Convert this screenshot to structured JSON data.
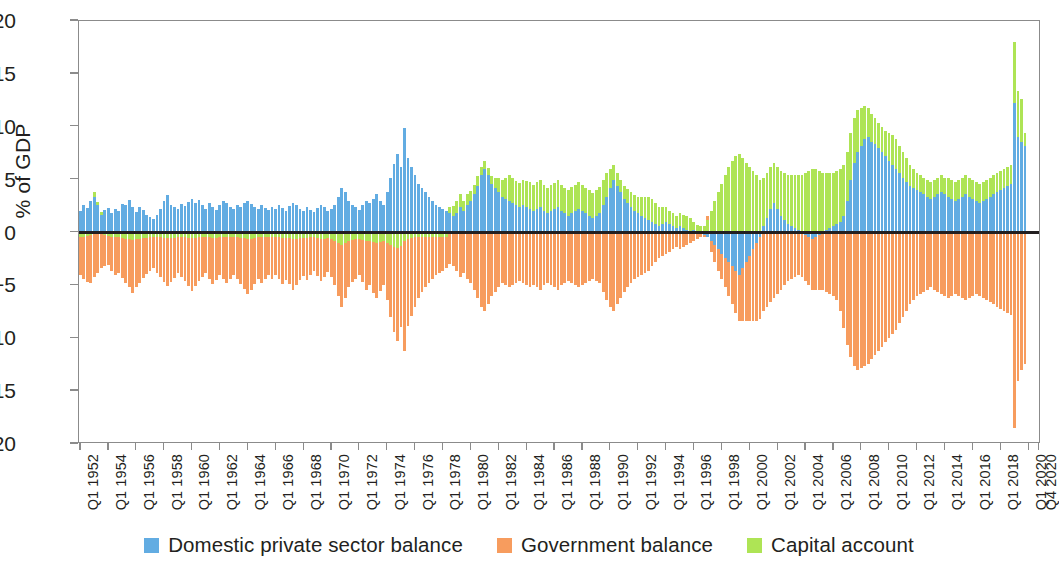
{
  "chart_data": {
    "type": "bar",
    "title": "",
    "subtitle": "",
    "xlabel": "",
    "ylabel": "% of GDP",
    "ylim": [
      -20,
      20
    ],
    "yticks": [
      20,
      15,
      10,
      5,
      0,
      -5,
      -10,
      -15,
      -20
    ],
    "ytick_labels": [
      "20",
      "15",
      "10",
      "5",
      "0",
      "−5",
      "−10",
      "−15",
      "−20"
    ],
    "grid": false,
    "stacked": true,
    "legend_position": "bottom",
    "bar_orientation": "vertical",
    "x_label_rotation": -90,
    "xtick_labels": [
      "Q1 1952",
      "Q1 1954",
      "Q1 1956",
      "Q1 1958",
      "Q1 1960",
      "Q1 1962",
      "Q1 1964",
      "Q1 1966",
      "Q1 1968",
      "Q1 1970",
      "Q1 1972",
      "Q1 1974",
      "Q1 1976",
      "Q1 1978",
      "Q1 1980",
      "Q1 1982",
      "Q1 1984",
      "Q1 1986",
      "Q1 1988",
      "Q1 1990",
      "Q1 1992",
      "Q1 1994",
      "Q1 1996",
      "Q1 1998",
      "Q1 2000",
      "Q1 2002",
      "Q1 2004",
      "Q1 2006",
      "Q1 2008",
      "Q1 2010",
      "Q1 2012",
      "Q1 2014",
      "Q1 2016",
      "Q1 2018",
      "Q1 2020",
      "Q4 2020"
    ],
    "xtick_quarter_index": [
      0,
      8,
      16,
      24,
      32,
      40,
      48,
      56,
      64,
      72,
      80,
      88,
      96,
      104,
      112,
      120,
      128,
      136,
      144,
      152,
      160,
      168,
      176,
      184,
      192,
      200,
      208,
      216,
      224,
      232,
      240,
      248,
      256,
      264,
      272,
      275
    ],
    "x_start": "Q1 1952",
    "x_end": "Q4 2020",
    "n_points": 276,
    "colors": {
      "domestic_private_sector_balance": "#62ACE2",
      "government_balance": "#F79C5E",
      "capital_account": "#AEE455",
      "axis": "#8b8b8b",
      "zero_line": "#231f20",
      "text": "#231f20",
      "background": "#ffffff"
    },
    "series": [
      {
        "name": "Domestic private sector balance",
        "color": "#62ACE2",
        "values": [
          2.0,
          2.6,
          2.3,
          3.0,
          3.4,
          2.6,
          1.7,
          2.1,
          2.3,
          1.8,
          2.2,
          2.0,
          2.7,
          2.6,
          3.1,
          2.4,
          1.9,
          2.4,
          2.1,
          1.7,
          1.5,
          1.3,
          1.7,
          2.2,
          3.0,
          3.5,
          2.6,
          2.4,
          2.2,
          2.7,
          2.5,
          2.9,
          3.2,
          2.8,
          3.1,
          2.6,
          2.2,
          2.8,
          2.4,
          2.1,
          2.6,
          3.0,
          2.8,
          2.4,
          2.2,
          2.6,
          2.4,
          2.8,
          3.0,
          2.7,
          2.4,
          2.2,
          2.6,
          2.3,
          2.1,
          2.4,
          2.2,
          2.6,
          2.3,
          2.0,
          2.5,
          2.8,
          2.6,
          2.2,
          2.0,
          2.4,
          2.1,
          1.9,
          2.3,
          2.6,
          2.4,
          2.0,
          2.2,
          2.6,
          3.4,
          4.2,
          3.8,
          3.0,
          2.6,
          2.4,
          2.1,
          2.6,
          3.0,
          2.8,
          3.2,
          3.6,
          3.0,
          2.6,
          3.8,
          5.2,
          6.5,
          7.4,
          6.2,
          9.9,
          7.0,
          6.2,
          5.4,
          4.6,
          4.2,
          3.8,
          3.4,
          3.0,
          2.6,
          2.4,
          2.2,
          2.0,
          1.8,
          1.6,
          1.8,
          2.4,
          2.0,
          2.6,
          3.0,
          3.6,
          4.4,
          5.4,
          6.0,
          5.4,
          4.6,
          4.2,
          3.8,
          3.4,
          3.2,
          3.0,
          2.8,
          2.6,
          2.4,
          2.6,
          2.4,
          2.2,
          2.0,
          2.2,
          2.4,
          2.0,
          1.8,
          2.0,
          2.2,
          2.4,
          2.0,
          1.8,
          1.6,
          1.8,
          2.0,
          2.2,
          2.0,
          1.8,
          1.6,
          1.4,
          1.6,
          1.8,
          2.6,
          3.4,
          4.2,
          5.0,
          4.4,
          3.8,
          3.2,
          2.8,
          2.4,
          2.0,
          1.8,
          1.6,
          1.4,
          1.2,
          1.0,
          0.8,
          0.6,
          0.8,
          1.0,
          0.8,
          0.6,
          0.4,
          0.6,
          0.4,
          0.2,
          0.1,
          0.2,
          0.1,
          0.0,
          -0.2,
          -0.4,
          -0.8,
          -1.2,
          -1.6,
          -2.0,
          -2.4,
          -2.8,
          -3.2,
          -3.6,
          -4.0,
          -3.4,
          -2.8,
          -2.2,
          -1.6,
          -1.0,
          -0.4,
          0.6,
          1.4,
          2.2,
          2.8,
          2.2,
          1.6,
          1.2,
          0.8,
          0.6,
          0.4,
          0.2,
          0.0,
          -0.2,
          -0.4,
          -0.6,
          -0.4,
          -0.2,
          0.0,
          0.2,
          0.4,
          0.6,
          0.8,
          1.0,
          1.6,
          3.0,
          5.0,
          6.6,
          7.6,
          8.2,
          8.8,
          9.0,
          8.6,
          8.4,
          8.0,
          7.6,
          7.2,
          6.8,
          6.4,
          6.0,
          5.6,
          5.2,
          4.8,
          4.4,
          4.2,
          4.0,
          3.8,
          3.6,
          3.4,
          3.2,
          3.4,
          3.6,
          3.8,
          3.6,
          3.4,
          3.2,
          3.0,
          3.2,
          3.4,
          3.6,
          3.4,
          3.2,
          3.0,
          2.8,
          3.0,
          3.2,
          3.4,
          3.6,
          3.8,
          4.0,
          4.2,
          4.4,
          4.6,
          12.2,
          9.0,
          8.6,
          8.2
        ]
      },
      {
        "name": "Government balance",
        "color": "#F79C5E",
        "values": [
          -3.6,
          -4.0,
          -4.4,
          -4.6,
          -4.2,
          -3.8,
          -3.4,
          -3.0,
          -2.8,
          -3.2,
          -3.6,
          -3.4,
          -3.8,
          -4.2,
          -4.6,
          -5.0,
          -4.6,
          -4.2,
          -3.8,
          -3.4,
          -3.2,
          -3.0,
          -3.4,
          -3.8,
          -4.2,
          -4.6,
          -4.2,
          -3.8,
          -3.4,
          -3.8,
          -4.2,
          -4.6,
          -5.0,
          -4.6,
          -4.2,
          -3.8,
          -3.4,
          -4.0,
          -4.4,
          -4.0,
          -3.6,
          -4.0,
          -4.4,
          -4.0,
          -3.6,
          -4.0,
          -4.4,
          -4.8,
          -5.2,
          -4.8,
          -4.4,
          -4.0,
          -4.4,
          -4.0,
          -3.6,
          -4.0,
          -3.6,
          -4.0,
          -4.4,
          -4.0,
          -4.4,
          -4.8,
          -4.4,
          -4.0,
          -3.6,
          -4.0,
          -3.6,
          -3.2,
          -3.6,
          -4.0,
          -3.6,
          -3.2,
          -3.6,
          -4.2,
          -5.0,
          -5.8,
          -5.2,
          -4.4,
          -4.0,
          -3.8,
          -3.4,
          -4.0,
          -4.6,
          -4.2,
          -4.8,
          -5.2,
          -4.6,
          -4.2,
          -5.4,
          -6.8,
          -8.0,
          -8.8,
          -7.6,
          -10.4,
          -8.2,
          -7.4,
          -6.6,
          -5.8,
          -5.2,
          -4.8,
          -4.4,
          -4.0,
          -3.6,
          -3.4,
          -3.2,
          -3.0,
          -3.0,
          -3.2,
          -3.6,
          -4.2,
          -3.8,
          -4.4,
          -4.8,
          -5.4,
          -6.2,
          -7.0,
          -7.4,
          -6.8,
          -6.0,
          -5.6,
          -5.2,
          -4.8,
          -5.0,
          -5.2,
          -5.0,
          -4.8,
          -4.6,
          -4.8,
          -5.0,
          -5.2,
          -5.0,
          -5.2,
          -5.4,
          -5.0,
          -4.8,
          -5.0,
          -5.2,
          -5.4,
          -5.0,
          -4.8,
          -4.6,
          -4.8,
          -5.0,
          -5.2,
          -5.0,
          -4.8,
          -4.6,
          -4.4,
          -4.6,
          -4.8,
          -5.6,
          -6.4,
          -7.0,
          -7.4,
          -6.8,
          -6.2,
          -5.6,
          -5.2,
          -4.8,
          -4.4,
          -4.2,
          -4.0,
          -3.8,
          -3.6,
          -3.2,
          -2.8,
          -2.4,
          -2.2,
          -2.0,
          -1.8,
          -1.6,
          -1.4,
          -1.6,
          -1.4,
          -1.2,
          -1.0,
          -0.8,
          -0.6,
          -0.4,
          -0.2,
          0.4,
          -1.0,
          -1.6,
          -2.0,
          -2.4,
          -2.8,
          -3.2,
          -3.6,
          -4.0,
          -4.4,
          -5.0,
          -5.6,
          -6.2,
          -6.8,
          -7.4,
          -7.8,
          -7.4,
          -7.0,
          -6.6,
          -6.2,
          -5.8,
          -5.4,
          -5.0,
          -4.6,
          -4.4,
          -4.2,
          -4.0,
          -4.2,
          -4.4,
          -4.6,
          -4.8,
          -5.0,
          -5.2,
          -5.4,
          -5.6,
          -5.8,
          -6.0,
          -6.4,
          -7.4,
          -9.0,
          -10.6,
          -11.8,
          -12.6,
          -13.0,
          -12.8,
          -12.6,
          -12.4,
          -12.0,
          -11.6,
          -11.2,
          -10.8,
          -10.4,
          -10.0,
          -9.6,
          -9.2,
          -8.6,
          -8.0,
          -7.4,
          -6.8,
          -6.4,
          -6.0,
          -5.8,
          -5.6,
          -5.4,
          -5.2,
          -5.4,
          -5.6,
          -5.8,
          -6.0,
          -6.2,
          -6.0,
          -5.8,
          -6.0,
          -6.2,
          -6.4,
          -6.2,
          -6.0,
          -5.8,
          -6.0,
          -6.2,
          -6.4,
          -6.6,
          -6.8,
          -7.0,
          -7.2,
          -7.4,
          -7.6,
          -7.8,
          -18.5,
          -14.0,
          -13.0,
          -12.4
        ]
      },
      {
        "name": "Capital account",
        "color": "#AEE455",
        "values": [
          -0.4,
          -0.4,
          -0.3,
          -0.2,
          0.4,
          0.3,
          0.2,
          -0.2,
          -0.3,
          -0.4,
          -0.4,
          -0.4,
          -0.5,
          -0.6,
          -0.6,
          -0.7,
          -0.6,
          -0.6,
          -0.5,
          -0.5,
          -0.4,
          -0.4,
          -0.4,
          -0.4,
          -0.5,
          -0.5,
          -0.5,
          -0.5,
          -0.4,
          -0.4,
          -0.4,
          -0.5,
          -0.5,
          -0.5,
          -0.4,
          -0.4,
          -0.4,
          -0.4,
          -0.5,
          -0.5,
          -0.4,
          -0.4,
          -0.4,
          -0.4,
          -0.4,
          -0.4,
          -0.5,
          -0.5,
          -0.6,
          -0.6,
          -0.5,
          -0.4,
          -0.4,
          -0.4,
          -0.4,
          -0.4,
          -0.4,
          -0.4,
          -0.5,
          -0.5,
          -0.5,
          -0.6,
          -0.6,
          -0.5,
          -0.5,
          -0.5,
          -0.4,
          -0.4,
          -0.5,
          -0.6,
          -0.6,
          -0.5,
          -0.6,
          -0.8,
          -1.0,
          -1.2,
          -1.0,
          -0.8,
          -0.7,
          -0.6,
          -0.6,
          -0.7,
          -0.8,
          -0.8,
          -0.9,
          -1.0,
          -0.9,
          -0.8,
          -1.0,
          -1.2,
          -1.4,
          -1.5,
          -1.3,
          -0.8,
          -0.6,
          -0.5,
          -0.4,
          -0.4,
          -0.4,
          -0.4,
          -0.4,
          -0.4,
          -0.4,
          -0.4,
          -0.4,
          -0.4,
          0.6,
          0.9,
          1.2,
          1.2,
          1.0,
          1.0,
          0.9,
          0.9,
          0.9,
          0.8,
          0.8,
          0.7,
          0.7,
          1.0,
          1.4,
          1.6,
          2.0,
          2.4,
          2.4,
          2.3,
          2.3,
          2.4,
          2.5,
          2.6,
          2.5,
          2.6,
          2.6,
          2.5,
          2.4,
          2.5,
          2.5,
          2.6,
          2.5,
          2.4,
          2.4,
          2.5,
          2.5,
          2.6,
          2.5,
          2.4,
          2.4,
          2.3,
          2.4,
          2.5,
          2.4,
          2.2,
          1.8,
          1.4,
          1.2,
          1.2,
          1.2,
          1.3,
          1.4,
          1.5,
          1.6,
          1.8,
          2.0,
          2.2,
          2.2,
          2.0,
          1.8,
          1.6,
          1.4,
          1.2,
          1.2,
          1.2,
          1.2,
          1.3,
          1.4,
          1.3,
          0.8,
          0.6,
          0.6,
          0.6,
          1.2,
          2.0,
          3.0,
          3.8,
          4.6,
          5.4,
          6.2,
          6.8,
          7.2,
          7.4,
          7.0,
          6.6,
          6.2,
          5.8,
          5.4,
          5.0,
          4.6,
          4.2,
          4.0,
          3.8,
          4.0,
          4.2,
          4.4,
          4.6,
          4.8,
          5.0,
          5.2,
          5.4,
          5.6,
          5.8,
          6.0,
          6.0,
          5.8,
          5.6,
          5.4,
          5.2,
          5.0,
          5.0,
          5.0,
          4.8,
          4.6,
          4.4,
          4.2,
          4.0,
          3.6,
          3.2,
          2.8,
          2.6,
          2.4,
          2.4,
          2.4,
          2.4,
          2.6,
          2.8,
          2.8,
          2.6,
          2.4,
          2.2,
          2.0,
          1.8,
          1.6,
          1.6,
          1.6,
          1.6,
          1.6,
          1.6,
          1.6,
          1.6,
          1.6,
          1.8,
          1.8,
          1.8,
          1.8,
          1.8,
          1.8,
          1.8,
          1.8,
          1.8,
          1.8,
          1.8,
          1.8,
          1.8,
          1.8,
          1.8,
          1.8,
          1.8,
          1.8,
          1.8,
          5.8,
          4.4,
          4.0,
          1.2
        ]
      }
    ],
    "legend": [
      {
        "label": "Domestic private sector balance",
        "color": "#62ACE2",
        "swatch": "square-swatch"
      },
      {
        "label": "Government balance",
        "color": "#F79C5E",
        "swatch": "square-swatch"
      },
      {
        "label": "Capital account",
        "color": "#AEE455",
        "swatch": "square-swatch"
      }
    ]
  }
}
